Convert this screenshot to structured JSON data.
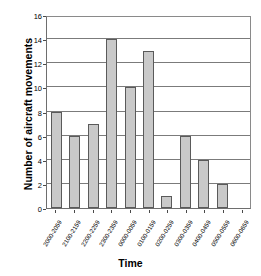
{
  "chart_data": {
    "type": "bar",
    "title": "",
    "xlabel": "Time",
    "ylabel": "Number of aircraft movements",
    "categories": [
      "2000-2059",
      "2100-2159",
      "2200-2259",
      "2300-2359",
      "0000-0059",
      "0100-0159",
      "0200-0259",
      "0300-0359",
      "0400-0459",
      "0500-0559",
      "0600-0659"
    ],
    "values": [
      8,
      6,
      7,
      14,
      10,
      13,
      1,
      6,
      4,
      2,
      0
    ],
    "ylim": [
      0,
      16
    ],
    "ytick_labels": [
      "0",
      "2",
      "4",
      "6",
      "8",
      "10",
      "12",
      "14",
      "16"
    ],
    "ytick_values": [
      0,
      2,
      4,
      6,
      8,
      10,
      12,
      14,
      16
    ],
    "grid": "horizontal",
    "legend": "none",
    "colors": {
      "bar_fill": "#c9c9c9",
      "bar_border": "#5a5a5a",
      "gridline": "#7b7b7b",
      "axis": "#6e6e6e",
      "text": "#000000",
      "background": "#ffffff"
    }
  }
}
